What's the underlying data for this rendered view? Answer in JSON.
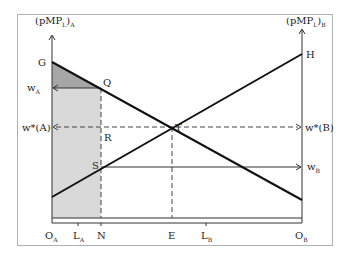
{
  "diagram": {
    "axes": {
      "left_label": "(pMP",
      "left_sub": "L",
      "left_sub2": "A",
      "right_label": "(pMP",
      "right_sub": "L",
      "right_sub2": "B"
    },
    "points": {
      "G": "G",
      "H": "H",
      "Q": "Q",
      "R": "R",
      "S": "S",
      "T": "T"
    },
    "wage_labels": {
      "wA": "w",
      "wA_sub": "A",
      "wstarA": "w*(A)",
      "wstarB": "w*(B)",
      "wB": "w",
      "wB_sub": "B"
    },
    "x_axis_labels": {
      "OA": "O",
      "OA_sub": "A",
      "LA": "L",
      "LA_sub": "A",
      "N": "N",
      "E": "E",
      "LB": "L",
      "LB_sub": "B",
      "OB": "O",
      "OB_sub": "B"
    },
    "colors": {
      "frame": "#b0b0b0",
      "line": "#111111",
      "shade_light": "#d9d9d9",
      "shade_dark": "#a6a6a6",
      "dash": "#444444"
    }
  }
}
